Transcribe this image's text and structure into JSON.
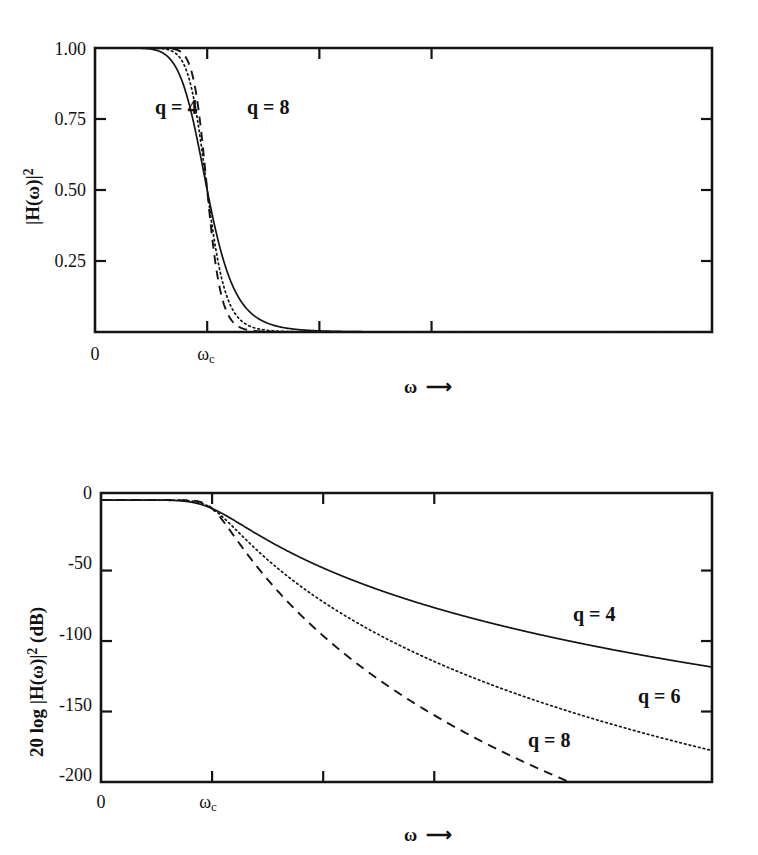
{
  "figure": {
    "background": "#ffffff",
    "ink_color": "#141414"
  },
  "chart_data": [
    {
      "id": "magnitude-squared-linear",
      "type": "line",
      "title": "",
      "xlabel": "ω",
      "ylabel": "|H(ω)|²",
      "xlim": [
        0,
        5.5
      ],
      "ylim": [
        0,
        1.0
      ],
      "grid": false,
      "legend": "inline-annotations",
      "x_tick_labels": [
        "0",
        "ωc"
      ],
      "x_tick_values": [
        0,
        1.0
      ],
      "x_tick_extra_values": [
        2.0,
        3.0
      ],
      "y_tick_labels": [
        "1.00",
        "0.75",
        "0.50",
        "0.25"
      ],
      "y_tick_values": [
        1.0,
        0.75,
        0.5,
        0.25
      ],
      "annotations": [
        {
          "text": "q = 4",
          "x": 0.58,
          "y": 0.855
        },
        {
          "text": "q = 8",
          "x": 1.38,
          "y": 0.855
        }
      ],
      "series": [
        {
          "name": "q = 4",
          "style": "solid",
          "order": 4
        },
        {
          "name": "q = 6",
          "style": "dotted",
          "order": 6
        },
        {
          "name": "q = 8",
          "style": "dashed",
          "order": 8
        }
      ],
      "formula": "|H(w)|^2 = 1 / (1 + (w/wc)^(2q))"
    },
    {
      "id": "magnitude-squared-decibel",
      "type": "line",
      "title": "",
      "xlabel": "ω",
      "ylabel": "20 log |H(ω)|² (dB)",
      "xlim": [
        0,
        5.5
      ],
      "ylim": [
        -200,
        5
      ],
      "grid": false,
      "legend": "inline-annotations",
      "x_tick_labels": [
        "0",
        "ωc"
      ],
      "x_tick_values": [
        0,
        1.0
      ],
      "x_tick_extra_values": [
        2.0,
        3.0
      ],
      "y_tick_labels": [
        "0",
        "-50",
        "-100",
        "-150",
        "-200"
      ],
      "y_tick_values": [
        0,
        -50,
        -100,
        -150,
        -200
      ],
      "annotations": [
        {
          "text": "q = 4",
          "x": 3.47,
          "y": -78
        },
        {
          "text": "q = 6",
          "x": 4.08,
          "y": -127
        },
        {
          "text": "q = 8",
          "x": 2.93,
          "y": -157
        }
      ],
      "series": [
        {
          "name": "q = 4",
          "style": "solid",
          "order": 4,
          "end_value_db": -150
        },
        {
          "name": "q = 6",
          "style": "dotted",
          "order": 6,
          "end_value_db": -200
        },
        {
          "name": "q = 8",
          "style": "dashed",
          "order": 8,
          "end_value_db": -200
        }
      ],
      "formula": "20 log10 |H(w)|^2 = -20 log10 (1 + (w/wc)^(2q))"
    }
  ],
  "top_plot": {
    "y_labels": [
      "1.00",
      "0.75",
      "0.50",
      "0.25"
    ],
    "x_origin_label": "0",
    "x_cutoff_label": "ω",
    "x_cutoff_subscript": "c",
    "y_axis_title_main": "|H(ω)|",
    "y_axis_title_exp": "2",
    "axis_omega": "ω",
    "axis_arrow": "⟶",
    "label_q4": "q = 4",
    "label_q8": "q = 8"
  },
  "bottom_plot": {
    "y_labels": [
      "0",
      "-50",
      "-100",
      "-150",
      "-200"
    ],
    "x_origin_label": "0",
    "x_cutoff_label": "ω",
    "x_cutoff_subscript": "c",
    "y_axis_title_pre": "20 log |H(ω)|",
    "y_axis_title_exp": "2",
    "y_axis_title_post": " (dB)",
    "axis_omega": "ω",
    "axis_arrow": "⟶",
    "label_q4": "q = 4",
    "label_q6": "q = 6",
    "label_q8": "q = 8"
  }
}
